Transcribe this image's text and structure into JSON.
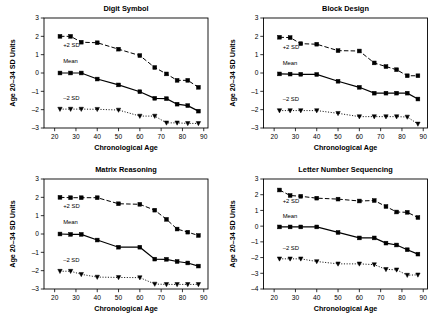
{
  "figure": {
    "background": "#ffffff",
    "ink": "#000000",
    "panel_count": 4
  },
  "common": {
    "xlabel": "Chronological Age",
    "ylabel": "Age 20–34 SD Units",
    "xlim": [
      15,
      92
    ],
    "xticks": [
      20,
      30,
      40,
      50,
      60,
      70,
      80,
      90
    ],
    "series_labels": {
      "plus": "+2 SD",
      "mean": "Mean",
      "minus": "–2 SD"
    }
  },
  "chart_data": [
    {
      "type": "line",
      "title": "Digit Symbol",
      "xlabel": "Chronological Age",
      "ylabel": "Age 20–34 SD Units",
      "xlim": [
        15,
        92
      ],
      "ylim": [
        -3,
        3
      ],
      "xticks": [
        20,
        30,
        40,
        50,
        60,
        70,
        80,
        90
      ],
      "yticks": [
        -3,
        -2,
        -1,
        0,
        1,
        2,
        3
      ],
      "grid": false,
      "legend": "inline-annotations",
      "x": [
        22.5,
        27.5,
        32.5,
        40,
        50,
        60,
        67,
        72.5,
        77.5,
        82.5,
        87.5
      ],
      "series": [
        {
          "name": "+2 SD",
          "marker": "square",
          "line": "dashed",
          "values": [
            2.0,
            2.0,
            1.68,
            1.65,
            1.3,
            0.95,
            0.3,
            -0.05,
            -0.4,
            -0.4,
            -0.78
          ]
        },
        {
          "name": "Mean",
          "marker": "square",
          "line": "solid",
          "values": [
            0.0,
            0.0,
            0.0,
            -0.33,
            -0.65,
            -1.02,
            -1.38,
            -1.4,
            -1.7,
            -1.78,
            -2.08
          ]
        },
        {
          "name": "–2 SD",
          "marker": "triangle-down",
          "line": "dotted",
          "values": [
            -1.97,
            -1.97,
            -1.97,
            -1.98,
            -2.02,
            -2.35,
            -2.35,
            -2.72,
            -2.72,
            -2.75,
            -2.75
          ]
        }
      ],
      "annotations": [
        {
          "text": "+2 SD",
          "x": 24,
          "y": 1.42
        },
        {
          "text": "Mean",
          "x": 24,
          "y": 0.52
        },
        {
          "text": "–2 SD",
          "x": 24,
          "y": -1.48
        }
      ]
    },
    {
      "type": "line",
      "title": "Block Design",
      "xlabel": "Chronological Age",
      "ylabel": "Age 20–34 SD Units",
      "xlim": [
        15,
        92
      ],
      "ylim": [
        -3,
        3
      ],
      "xticks": [
        20,
        30,
        40,
        50,
        60,
        70,
        80,
        90
      ],
      "yticks": [
        -3,
        -2,
        -1,
        0,
        1,
        2,
        3
      ],
      "grid": false,
      "legend": "inline-annotations",
      "x": [
        22.5,
        27.5,
        32.5,
        40,
        50,
        60,
        67,
        72.5,
        77.5,
        82.5,
        87.5
      ],
      "series": [
        {
          "name": "+2 SD",
          "marker": "square",
          "line": "dashed",
          "values": [
            1.95,
            1.93,
            1.6,
            1.57,
            1.22,
            1.2,
            0.55,
            0.35,
            0.18,
            -0.15,
            -0.15
          ]
        },
        {
          "name": "Mean",
          "marker": "square",
          "line": "solid",
          "values": [
            -0.05,
            -0.06,
            -0.07,
            -0.08,
            -0.45,
            -0.78,
            -1.1,
            -1.1,
            -1.1,
            -1.1,
            -1.42
          ]
        },
        {
          "name": "–2 SD",
          "marker": "triangle-down",
          "line": "dotted",
          "values": [
            -2.05,
            -2.05,
            -2.05,
            -2.05,
            -2.2,
            -2.38,
            -2.38,
            -2.38,
            -2.38,
            -2.4,
            -2.78
          ]
        }
      ],
      "annotations": [
        {
          "text": "+2 SD",
          "x": 24,
          "y": 1.3
        },
        {
          "text": "Mean",
          "x": 24,
          "y": 0.42
        },
        {
          "text": "–2 SD",
          "x": 24,
          "y": -1.52
        }
      ]
    },
    {
      "type": "line",
      "title": "Matrix Reasoning",
      "xlabel": "Chronological Age",
      "ylabel": "Age 20–34 SD Units",
      "xlim": [
        15,
        92
      ],
      "ylim": [
        -3,
        3
      ],
      "xticks": [
        20,
        30,
        40,
        50,
        60,
        70,
        80,
        90
      ],
      "yticks": [
        -3,
        -2,
        -1,
        0,
        1,
        2,
        3
      ],
      "grid": false,
      "legend": "inline-annotations",
      "x": [
        22.5,
        27.5,
        32.5,
        40,
        50,
        60,
        67,
        72.5,
        77.5,
        82.5,
        87.5
      ],
      "series": [
        {
          "name": "+2 SD",
          "marker": "square",
          "line": "dashed",
          "values": [
            2.0,
            1.98,
            1.98,
            1.98,
            1.65,
            1.62,
            1.3,
            0.8,
            0.27,
            0.1,
            -0.08
          ]
        },
        {
          "name": "Mean",
          "marker": "square",
          "line": "solid",
          "values": [
            0.0,
            -0.02,
            -0.02,
            -0.33,
            -0.72,
            -0.72,
            -1.37,
            -1.38,
            -1.5,
            -1.58,
            -1.75
          ]
        },
        {
          "name": "–2 SD",
          "marker": "triangle-down",
          "line": "dotted",
          "values": [
            -2.03,
            -2.03,
            -2.2,
            -2.35,
            -2.37,
            -2.38,
            -2.73,
            -2.75,
            -2.75,
            -2.75,
            -2.75
          ]
        }
      ],
      "annotations": [
        {
          "text": "+2 SD",
          "x": 24,
          "y": 1.42
        },
        {
          "text": "Mean",
          "x": 24,
          "y": 0.55
        },
        {
          "text": "–2 SD",
          "x": 24,
          "y": -1.5
        }
      ]
    },
    {
      "type": "line",
      "title": "Letter Number Sequencing",
      "xlabel": "Chronological Age",
      "ylabel": "Age 20–34 SD Units",
      "xlim": [
        15,
        92
      ],
      "ylim": [
        -4,
        3
      ],
      "xticks": [
        20,
        30,
        40,
        50,
        60,
        70,
        80,
        90
      ],
      "yticks": [
        -4,
        -3,
        -2,
        -1,
        0,
        1,
        2,
        3
      ],
      "grid": false,
      "legend": "inline-annotations",
      "x": [
        22.5,
        27.5,
        32.5,
        40,
        50,
        60,
        67,
        72.5,
        77.5,
        82.5,
        87.5
      ],
      "series": [
        {
          "name": "+2 SD",
          "marker": "square",
          "line": "dashed",
          "values": [
            2.3,
            1.95,
            1.9,
            1.78,
            1.72,
            1.6,
            1.63,
            1.25,
            0.9,
            0.88,
            0.55
          ]
        },
        {
          "name": "Mean",
          "marker": "square",
          "line": "solid",
          "values": [
            -0.05,
            -0.05,
            -0.05,
            -0.05,
            -0.4,
            -0.75,
            -0.75,
            -1.08,
            -1.2,
            -1.5,
            -1.78
          ]
        },
        {
          "name": "–2 SD",
          "marker": "triangle-down",
          "line": "dotted",
          "values": [
            -2.08,
            -2.08,
            -2.08,
            -2.25,
            -2.4,
            -2.4,
            -2.45,
            -2.75,
            -2.78,
            -3.12,
            -3.1
          ]
        }
      ],
      "annotations": [
        {
          "text": "+2 SD",
          "x": 24,
          "y": 1.45
        },
        {
          "text": "Mean",
          "x": 24,
          "y": 0.55
        },
        {
          "text": "–2 SD",
          "x": 24,
          "y": -1.5
        }
      ]
    }
  ]
}
